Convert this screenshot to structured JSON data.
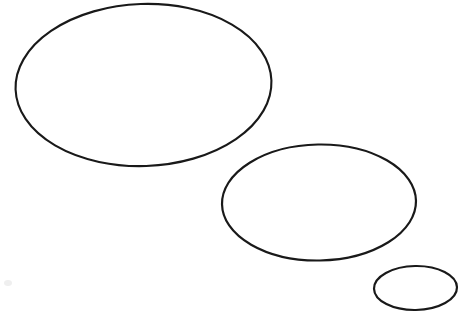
{
  "canvas": {
    "width": 471,
    "height": 317,
    "background_color": "#ffffff",
    "title": "Three Ellipses Sketch"
  },
  "style": {
    "stroke_color": "#191919",
    "fill": "none",
    "smudge_color": "#efefef"
  },
  "chart_data": {
    "type": "scatter",
    "title": "",
    "xlabel": "",
    "ylabel": "",
    "grid": false,
    "legend": "none",
    "xlim": [
      0,
      471
    ],
    "ylim": [
      0,
      317
    ],
    "shapes": [
      {
        "name": "large-ellipse",
        "label": "Large ellipse",
        "cx": 143.5,
        "cy": 85,
        "rx": 128,
        "ry": 81,
        "rotation": -2,
        "stroke_width": 2.1,
        "bbox": [
          15,
          4,
          272,
          166
        ]
      },
      {
        "name": "medium-ellipse",
        "label": "Medium ellipse",
        "cx": 319,
        "cy": 202.5,
        "rx": 97,
        "ry": 58,
        "rotation": -1,
        "stroke_width": 2.2,
        "bbox": [
          222,
          145,
          416,
          260
        ]
      },
      {
        "name": "small-ellipse",
        "label": "Small ellipse",
        "cx": 415.5,
        "cy": 288,
        "rx": 41.5,
        "ry": 22,
        "rotation": -1,
        "stroke_width": 2.2,
        "bbox": [
          374,
          266,
          457,
          310
        ]
      }
    ],
    "marks": [
      {
        "name": "faint-smudge",
        "cx": 8,
        "cy": 283,
        "rx": 4,
        "ry": 3
      }
    ]
  }
}
